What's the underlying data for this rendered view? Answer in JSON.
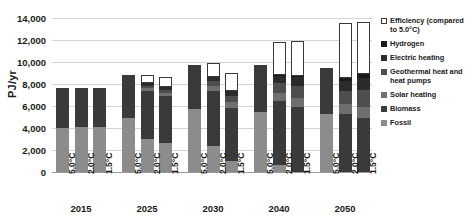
{
  "chart_data": {
    "type": "bar",
    "subtype": "stacked-bar",
    "title": "",
    "xlabel": "",
    "ylabel": "PJ/yr",
    "ylim": [
      0,
      14000
    ],
    "ytick_values": [
      0,
      2000,
      4000,
      6000,
      8000,
      10000,
      12000,
      14000
    ],
    "ytick_labels": [
      "0",
      "2,000",
      "4,000",
      "6,000",
      "8,000",
      "10,000",
      "12,000",
      "14,000"
    ],
    "grid": true,
    "legend_position": "right",
    "groups": [
      "2015",
      "2025",
      "2030",
      "2040",
      "2050"
    ],
    "categories": [
      "5.0°C",
      "2.0°C",
      "1.5°C",
      "5.0°C",
      "2.0°C",
      "1.5°C",
      "5.0°C",
      "2.0°C",
      "1.5°C",
      "5.0°C",
      "2.0°C",
      "1.5°C",
      "5.0°C",
      "2.0°C",
      "1.5°C"
    ],
    "series": [
      {
        "name": "Fossil",
        "color": "#8c8c8c",
        "values": [
          4000,
          4050,
          4050,
          4950,
          3000,
          2600,
          5750,
          2350,
          1000,
          5450,
          600,
          0,
          5250,
          0,
          0
        ]
      },
      {
        "name": "Biomass",
        "color": "#3a3a3a",
        "values": [
          3650,
          3600,
          3600,
          3900,
          4350,
          4300,
          3950,
          5050,
          4850,
          4250,
          5900,
          5900,
          4200,
          5250,
          4950
        ]
      },
      {
        "name": "Solar heating",
        "color": "#6f6f6f",
        "values": [
          0,
          0,
          0,
          0,
          250,
          300,
          0,
          400,
          500,
          0,
          700,
          800,
          0,
          900,
          1000
        ]
      },
      {
        "name": "Geothermal heat and heat pumps",
        "color": "#4e4e4e",
        "values": [
          0,
          0,
          0,
          0,
          250,
          300,
          0,
          450,
          600,
          0,
          900,
          1100,
          0,
          1250,
          1500
        ]
      },
      {
        "name": "Electric heating",
        "color": "#2b2b2b",
        "values": [
          0,
          0,
          0,
          0,
          200,
          250,
          0,
          350,
          450,
          0,
          650,
          800,
          0,
          900,
          1100
        ]
      },
      {
        "name": "Hydrogen",
        "color": "#1a1a1a",
        "values": [
          0,
          0,
          0,
          0,
          0,
          0,
          0,
          0,
          0,
          0,
          100,
          150,
          0,
          250,
          350
        ]
      },
      {
        "name": "Efficiency (compared to 5.0°C)",
        "color": "#ffffff",
        "values": [
          0,
          0,
          0,
          0,
          750,
          900,
          0,
          1300,
          1600,
          0,
          3000,
          3150,
          0,
          5000,
          4700
        ]
      }
    ]
  },
  "legend": {
    "items": [
      {
        "label": "Efficiency (compared to 5.0°C)",
        "marker": "hollow"
      },
      {
        "label": "Hydrogen",
        "marker": "solid"
      },
      {
        "label": "Electric heating",
        "marker": "solid"
      },
      {
        "label": "Geothermal heat and heat pumps",
        "marker": "solid"
      },
      {
        "label": "Solar heating",
        "marker": "solid"
      },
      {
        "label": "Biomass",
        "marker": "solid"
      },
      {
        "label": "Fossil",
        "marker": "solid"
      }
    ]
  }
}
